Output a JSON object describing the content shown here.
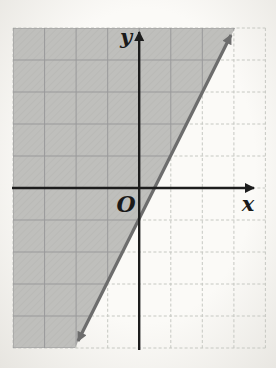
{
  "figure": {
    "type": "linear-inequality-graph-on-grid",
    "axis_labels": {
      "x": "x",
      "y": "y",
      "origin": "O"
    },
    "grid": {
      "columns": 8,
      "rows": 10,
      "cell_shape": "square"
    },
    "boundary_line": {
      "description": "gray line with arrowheads on both ends rising left-to-right",
      "slope_grid_units": 2,
      "x_intercept_grid_units": 0.5,
      "y_intercept_grid_units": -1
    },
    "shaded_region": {
      "side": "above-left-of-line",
      "texture": "gray-hatch"
    }
  },
  "colors": {
    "paper": "#fbfaf7",
    "paper_edge": "#e7e5e0",
    "shade": "#bfbfbc",
    "hatch": "#a8a8a5",
    "grid_light": "#c6c8c2",
    "grid_dark": "#99999a",
    "axis": "#1d1d1d",
    "line": "#6d6d6d",
    "ink": "#1a1a1a"
  }
}
